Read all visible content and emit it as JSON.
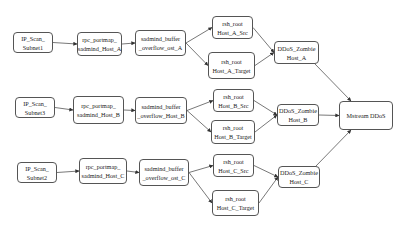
{
  "diagram": {
    "nodes": [
      {
        "id": "scan1",
        "lines": [
          "IP_Scan_",
          "Subnet1"
        ],
        "x": 13,
        "y": 32,
        "w": 40,
        "h": 21
      },
      {
        "id": "rpcA",
        "lines": [
          "rpc_portmap_",
          "sadmind_Host_A"
        ],
        "x": 77,
        "y": 32,
        "w": 45,
        "h": 24
      },
      {
        "id": "bofA",
        "lines": [
          "sadmind_buffer",
          "_overflow_ost_A"
        ],
        "x": 135,
        "y": 30,
        "w": 51,
        "h": 26
      },
      {
        "id": "rshASrc",
        "lines": [
          "rsh_root",
          "Host_A_Src"
        ],
        "x": 212,
        "y": 16,
        "w": 41,
        "h": 23
      },
      {
        "id": "rshATgt",
        "lines": [
          "rsh_root",
          "Host_A_Target"
        ],
        "x": 208,
        "y": 52,
        "w": 47,
        "h": 27
      },
      {
        "id": "zombA",
        "lines": [
          "DDoS_Zombie",
          "Host_A"
        ],
        "x": 274,
        "y": 41,
        "w": 45,
        "h": 23
      },
      {
        "id": "scan3",
        "lines": [
          "IP_Scan_",
          "Subnet3"
        ],
        "x": 15,
        "y": 97,
        "w": 40,
        "h": 21
      },
      {
        "id": "rpcB",
        "lines": [
          "rpc_portmap_",
          "sadmind_Host_B"
        ],
        "x": 73,
        "y": 96,
        "w": 51,
        "h": 28
      },
      {
        "id": "bofB",
        "lines": [
          "sadmind_buffer",
          "_overflow_Host_B"
        ],
        "x": 135,
        "y": 97,
        "w": 52,
        "h": 27
      },
      {
        "id": "rshBSrc",
        "lines": [
          "rsh_root",
          "Host_B_Src"
        ],
        "x": 213,
        "y": 89,
        "w": 41,
        "h": 23
      },
      {
        "id": "rshBTgt",
        "lines": [
          "rsh_root",
          "Host_B_Target"
        ],
        "x": 211,
        "y": 120,
        "w": 44,
        "h": 24
      },
      {
        "id": "zombB",
        "lines": [
          "DDoS_Zombie",
          "Host_B"
        ],
        "x": 277,
        "y": 104,
        "w": 42,
        "h": 22
      },
      {
        "id": "mstream",
        "lines": [
          "Mstream DDoS"
        ],
        "x": 339,
        "y": 101,
        "w": 54,
        "h": 29
      },
      {
        "id": "scan2",
        "lines": [
          "IP_Scan_",
          "Subnet2"
        ],
        "x": 17,
        "y": 162,
        "w": 40,
        "h": 21
      },
      {
        "id": "rpcC",
        "lines": [
          "rpc_portmap_",
          "sadmind_Host_C"
        ],
        "x": 79,
        "y": 158,
        "w": 48,
        "h": 26
      },
      {
        "id": "bofC",
        "lines": [
          "sadmind_buffer",
          "_overflow_ost_C"
        ],
        "x": 139,
        "y": 159,
        "w": 50,
        "h": 27
      },
      {
        "id": "rshCSrc",
        "lines": [
          "rsh_root",
          "Host_C_Src"
        ],
        "x": 213,
        "y": 154,
        "w": 41,
        "h": 23
      },
      {
        "id": "rshCTgt",
        "lines": [
          "rsh_root",
          "Host_C_Target"
        ],
        "x": 212,
        "y": 190,
        "w": 47,
        "h": 26
      },
      {
        "id": "zombC",
        "lines": [
          "DDoS_Zombie",
          "Host_C"
        ],
        "x": 278,
        "y": 166,
        "w": 42,
        "h": 22
      }
    ],
    "edges": [
      [
        "scan1",
        "rpcA"
      ],
      [
        "rpcA",
        "bofA"
      ],
      [
        "bofA",
        "rshASrc"
      ],
      [
        "bofA",
        "rshATgt"
      ],
      [
        "rshASrc",
        "zombA"
      ],
      [
        "rshATgt",
        "zombA"
      ],
      [
        "zombA",
        "mstream"
      ],
      [
        "scan3",
        "rpcB"
      ],
      [
        "rpcB",
        "bofB"
      ],
      [
        "bofB",
        "rshBSrc"
      ],
      [
        "bofB",
        "rshBTgt"
      ],
      [
        "rshBSrc",
        "zombB"
      ],
      [
        "rshBTgt",
        "zombB"
      ],
      [
        "zombB",
        "mstream"
      ],
      [
        "scan2",
        "rpcC"
      ],
      [
        "rpcC",
        "bofC"
      ],
      [
        "bofC",
        "rshCSrc"
      ],
      [
        "bofC",
        "rshCTgt"
      ],
      [
        "rshCSrc",
        "zombC"
      ],
      [
        "rshCTgt",
        "zombC"
      ],
      [
        "zombC",
        "mstream"
      ]
    ],
    "colors": {
      "stroke": "#555555",
      "text": "#222222",
      "background": "#ffffff"
    }
  }
}
